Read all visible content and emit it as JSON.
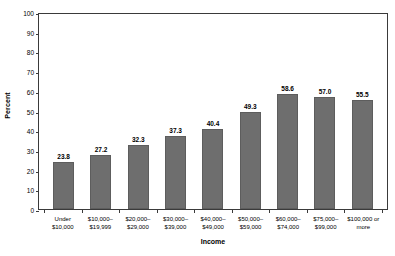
{
  "chart_data": {
    "type": "bar",
    "title": "",
    "xlabel": "Income",
    "ylabel": "Percent",
    "ylim": [
      0,
      100
    ],
    "yticks": [
      0,
      10,
      20,
      30,
      40,
      50,
      60,
      70,
      80,
      90,
      100
    ],
    "grid": false,
    "legend": false,
    "bar_color": "#6e6e6e",
    "axis_color": "#3a3a3a",
    "categories": [
      {
        "line1": "Under $10,000",
        "line2": ""
      },
      {
        "line1": "$10,000–",
        "line2": "$19,999"
      },
      {
        "line1": "$20,000–",
        "line2": "$29,000"
      },
      {
        "line1": "$30,000–",
        "line2": "$39,000"
      },
      {
        "line1": "$40,000–",
        "line2": "$49,000"
      },
      {
        "line1": "$50,000–",
        "line2": "$59,000"
      },
      {
        "line1": "$60,000–",
        "line2": "$74,000"
      },
      {
        "line1": "$75,000–",
        "line2": "$99,000"
      },
      {
        "line1": "$100,000 or",
        "line2": "more"
      }
    ],
    "values": [
      23.8,
      27.2,
      32.3,
      37.3,
      40.4,
      49.3,
      58.6,
      57.0,
      55.5
    ],
    "value_labels": [
      "23.8",
      "27.2",
      "32.3",
      "37.3",
      "40.4",
      "49.3",
      "58.6",
      "57.0",
      "55.5"
    ]
  }
}
